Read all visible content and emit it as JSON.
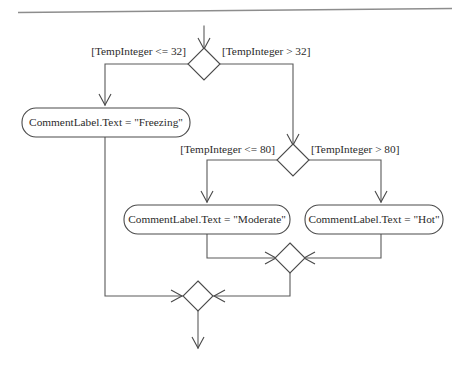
{
  "diagram": {
    "type": "uml-activity-diagram",
    "canvas": {
      "width": 468,
      "height": 366,
      "background": "#ffffff"
    },
    "colors": {
      "line": "#5a5a5a",
      "node_stroke": "#4a4a4a",
      "node_fill": "#ffffff",
      "text": "#2b2b2b",
      "top_rule": "#8d8d8d"
    },
    "top_rule": {
      "name": "page-divider-rule",
      "x1": 18,
      "y1": 12,
      "x2": 452,
      "y2": 8
    },
    "decisions": [
      {
        "id": "decision-freezing",
        "name": "decision-node-temp-32",
        "cx": 204,
        "cy": 64,
        "rx": 16,
        "ry": 16,
        "guard_left": "[TempInteger <= 32]",
        "guard_right": "[TempInteger > 32]",
        "guard_left_x": 186,
        "guard_left_y": 52,
        "guard_right_x": 222,
        "guard_right_y": 52
      },
      {
        "id": "decision-moderate",
        "name": "decision-node-temp-80",
        "cx": 293,
        "cy": 160,
        "rx": 16,
        "ry": 16,
        "guard_left": "[TempInteger <= 80]",
        "guard_right": "[TempInteger > 80]",
        "guard_left_x": 275,
        "guard_left_y": 150,
        "guard_right_x": 311,
        "guard_right_y": 150
      }
    ],
    "actions": [
      {
        "id": "action-freezing",
        "name": "action-node-freezing",
        "label": "CommentLabel.Text = \"Freezing\"",
        "x": 22,
        "y": 108,
        "width": 168,
        "height": 29,
        "radius": 14
      },
      {
        "id": "action-moderate",
        "name": "action-node-moderate",
        "label": "CommentLabel.Text = \"Moderate\"",
        "x": 124,
        "y": 205,
        "width": 166,
        "height": 29,
        "radius": 14
      },
      {
        "id": "action-hot",
        "name": "action-node-hot",
        "label": "CommentLabel.Text = \"Hot\"",
        "x": 305,
        "y": 205,
        "width": 138,
        "height": 29,
        "radius": 14
      }
    ],
    "merges": [
      {
        "id": "merge-inner",
        "name": "merge-node-inner",
        "cx": 290,
        "cy": 258,
        "rx": 15,
        "ry": 15
      },
      {
        "id": "merge-outer",
        "name": "merge-node-outer",
        "cx": 198,
        "cy": 296,
        "rx": 15,
        "ry": 15
      }
    ],
    "edges": [
      {
        "id": "edge-entry",
        "name": "edge-entry-to-decision-32",
        "points": "204,28 204,48",
        "arrow": "down",
        "arrow_at": "204,48"
      },
      {
        "id": "edge-32-false",
        "name": "edge-temp32-false-to-freezing",
        "points": "188,64 105,64 105,104",
        "arrow": "down",
        "arrow_at": "105,104"
      },
      {
        "id": "edge-32-true",
        "name": "edge-temp32-true-to-decision-80",
        "points": "220,64 293,64 293,144",
        "arrow": "down",
        "arrow_at": "293,144"
      },
      {
        "id": "edge-80-false",
        "name": "edge-temp80-false-to-moderate",
        "points": "277,160 207,160 207,201",
        "arrow": "down",
        "arrow_at": "207,201"
      },
      {
        "id": "edge-80-true",
        "name": "edge-temp80-true-to-hot",
        "points": "309,160 381,160 381,201",
        "arrow": "down",
        "arrow_at": "381,201"
      },
      {
        "id": "edge-moderate-merge",
        "name": "edge-moderate-to-merge-inner",
        "points": "207,234 207,258 275,258",
        "arrow": "right",
        "arrow_at": "275,258"
      },
      {
        "id": "edge-hot-merge",
        "name": "edge-hot-to-merge-inner",
        "points": "381,234 381,258 305,258",
        "arrow": "left",
        "arrow_at": "305,258"
      },
      {
        "id": "edge-merge-inner-outer",
        "name": "edge-merge-inner-to-merge-outer",
        "points": "290,273 290,296 213,296",
        "arrow": "right",
        "arrow_at": "213,296"
      },
      {
        "id": "edge-freezing-merge",
        "name": "edge-freezing-to-merge-outer",
        "points": "105,137 105,296 183,296",
        "arrow": "right",
        "arrow_at": "183,296"
      },
      {
        "id": "edge-exit",
        "name": "edge-merge-outer-to-exit",
        "points": "198,311 198,348",
        "arrow": "down",
        "arrow_at": "198,348"
      }
    ]
  }
}
